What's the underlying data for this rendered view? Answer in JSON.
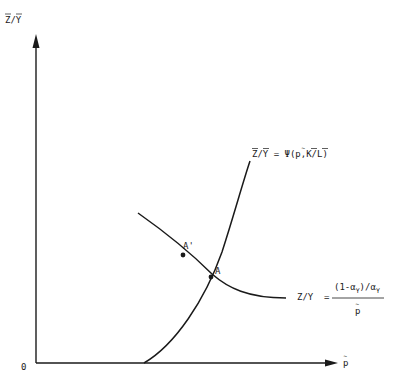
{
  "figure": {
    "axes": {
      "y_label": "Z/Y",
      "y_label_overbar": true,
      "x_label": "p",
      "x_label_tilde": true,
      "origin_label": "0"
    },
    "curves": [
      {
        "id": "psi-curve",
        "shape": "increasing-convex",
        "label": "Z/Y = Ψ(p,K/L)",
        "label_parts": {
          "lhs": "Z/Y",
          "eq": "=",
          "rhs": "Ψ(p,K/L)"
        }
      },
      {
        "id": "ratio-curve",
        "shape": "decreasing-convex",
        "label_lhs": "Z/Y",
        "label_eq": "=",
        "numerator": "(1-α",
        "numerator_sub": "Y",
        "numerator_mid": ")/α",
        "numerator_sub2": "Y",
        "denominator": "p"
      }
    ],
    "points": [
      {
        "label": "A'",
        "on": "ratio-curve"
      },
      {
        "label": "A",
        "on": "intersection"
      }
    ],
    "colors": {
      "ink": "#1a1a1a",
      "background": "#ffffff"
    }
  }
}
